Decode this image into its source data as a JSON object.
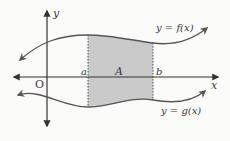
{
  "diagram": {
    "colors": {
      "curve": "#555555",
      "axis": "#333333",
      "shade": "#c8c8c8",
      "background": "#fbfbfa"
    },
    "labels": {
      "y_axis": "y",
      "x_axis": "x",
      "origin": "O",
      "a": "a",
      "b": "b",
      "region": "A",
      "upper_curve": "y = f(x)",
      "lower_curve": "y = g(x)"
    },
    "shaded_region": {
      "between": [
        "f(x)",
        "g(x)"
      ],
      "from": "a",
      "to": "b",
      "name": "A"
    }
  }
}
